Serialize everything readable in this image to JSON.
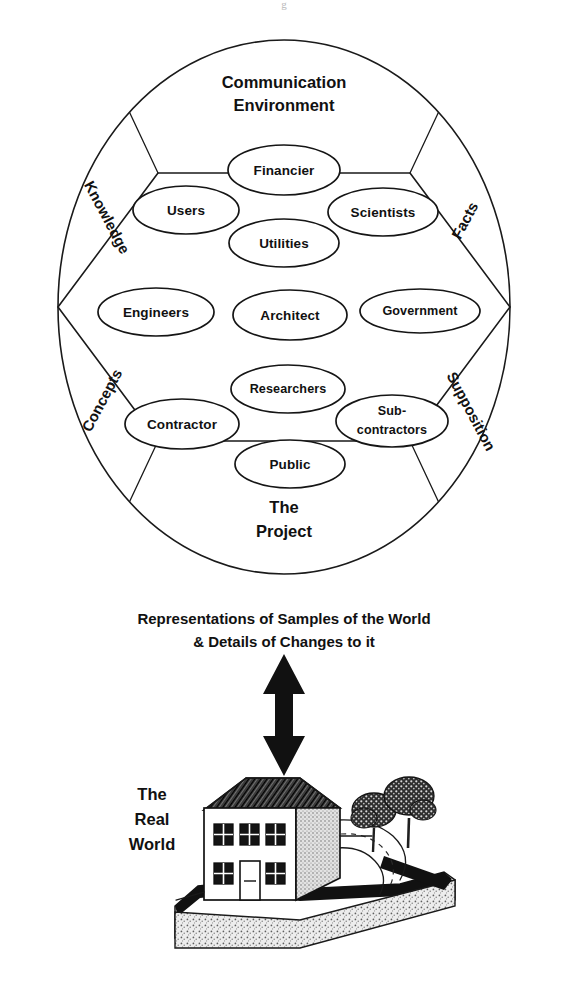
{
  "figure": {
    "top_fragment": "g"
  },
  "circle_diagram": {
    "top_segment": {
      "line1": "Communication",
      "line2": "Environment"
    },
    "bottom_segment": {
      "line1": "The",
      "line2": "Project"
    },
    "side_segments": [
      {
        "name": "knowledge",
        "label": "Knowledge",
        "position": "upper-left"
      },
      {
        "name": "facts",
        "label": "Facts",
        "position": "upper-right"
      },
      {
        "name": "concepts",
        "label": "Concepts",
        "position": "lower-left"
      },
      {
        "name": "supposition",
        "label": "Supposition",
        "position": "lower-right"
      }
    ],
    "actors": [
      {
        "name": "financier",
        "label": "Financier",
        "cx": 284,
        "cy": 170,
        "rx": 56,
        "ry": 25
      },
      {
        "name": "users",
        "label": "Users",
        "cx": 186,
        "cy": 210,
        "rx": 53,
        "ry": 24
      },
      {
        "name": "scientists",
        "label": "Scientists",
        "cx": 383,
        "cy": 212,
        "rx": 55,
        "ry": 24
      },
      {
        "name": "utilities",
        "label": "Utilities",
        "cx": 284,
        "cy": 243,
        "rx": 55,
        "ry": 24
      },
      {
        "name": "engineers",
        "label": "Engineers",
        "cx": 156,
        "cy": 312,
        "rx": 58,
        "ry": 24
      },
      {
        "name": "architect",
        "label": "Architect",
        "cx": 290,
        "cy": 315,
        "rx": 57,
        "ry": 25
      },
      {
        "name": "government",
        "label": "Government",
        "cx": 420,
        "cy": 311,
        "rx": 60,
        "ry": 22
      },
      {
        "name": "researchers",
        "label": "Researchers",
        "cx": 288,
        "cy": 389,
        "rx": 57,
        "ry": 24
      },
      {
        "name": "contractor",
        "label": "Contractor",
        "cx": 182,
        "cy": 424,
        "rx": 57,
        "ry": 25
      },
      {
        "name": "sub-contractors",
        "label_line1": "Sub-",
        "label_line2": "contractors",
        "cx": 392,
        "cy": 421,
        "rx": 56,
        "ry": 26
      },
      {
        "name": "public",
        "label": "Public",
        "cx": 290,
        "cy": 464,
        "rx": 55,
        "ry": 24
      }
    ]
  },
  "link_caption": {
    "line1": "Representations of Samples of the World",
    "line2": "& Details of Changes to it"
  },
  "real_world": {
    "line1": "The",
    "line2": "Real",
    "line3": "World"
  },
  "colors": {
    "ink": "#111111",
    "paper": "#ffffff",
    "shade": "#cfcfcf",
    "roof": "#2b2b2b"
  }
}
